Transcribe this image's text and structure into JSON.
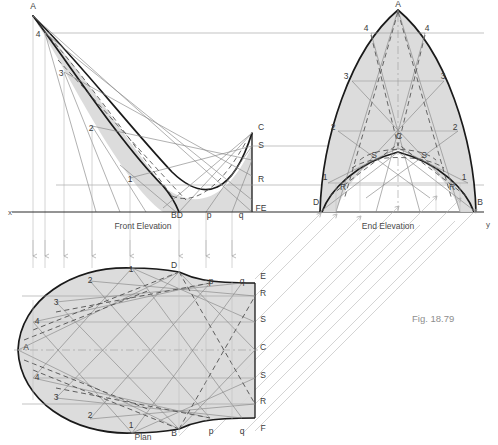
{
  "figure": {
    "caption": "Fig. 18.79",
    "caption_pos": {
      "x": 412,
      "y": 322
    }
  },
  "colors": {
    "outline": "#1a1a1a",
    "thin_line": "#9a9a9a",
    "medium_line": "#7d7d7d",
    "dashed_line": "#555555",
    "fill": "#d9d9d9",
    "fill_dark": "#cfcfcf",
    "projector": "#a8a8a8",
    "label_text": "#3a3a3a",
    "caption_text": "#8e8e8e",
    "background": "#ffffff"
  },
  "views": {
    "front_elevation": {
      "title": "Front Elevation",
      "title_pos": {
        "x": 143,
        "y": 229
      },
      "labels": [
        {
          "text": "A",
          "x": 33,
          "y": 9
        },
        {
          "text": "4",
          "x": 38,
          "y": 37
        },
        {
          "text": "3",
          "x": 61,
          "y": 76
        },
        {
          "text": "2",
          "x": 91,
          "y": 131
        },
        {
          "text": "1",
          "x": 130,
          "y": 182
        },
        {
          "text": "C",
          "x": 261,
          "y": 130
        },
        {
          "text": "S",
          "x": 261,
          "y": 148
        },
        {
          "text": "R",
          "x": 261,
          "y": 182
        },
        {
          "text": "FE",
          "x": 261,
          "y": 211
        },
        {
          "text": "BD",
          "x": 177,
          "y": 218
        },
        {
          "text": "p",
          "x": 209,
          "y": 218
        },
        {
          "text": "q",
          "x": 241,
          "y": 218
        }
      ]
    },
    "end_elevation": {
      "title": "End Elevation",
      "title_pos": {
        "x": 388,
        "y": 229
      },
      "labels": [
        {
          "text": "A",
          "x": 398,
          "y": 7
        },
        {
          "text": "4",
          "x": 366,
          "y": 31
        },
        {
          "text": "4",
          "x": 427,
          "y": 31
        },
        {
          "text": "3",
          "x": 346,
          "y": 79
        },
        {
          "text": "3",
          "x": 443,
          "y": 79
        },
        {
          "text": "2",
          "x": 333,
          "y": 130
        },
        {
          "text": "2",
          "x": 455,
          "y": 130
        },
        {
          "text": "1",
          "x": 325,
          "y": 180
        },
        {
          "text": "1",
          "x": 464,
          "y": 180
        },
        {
          "text": "C",
          "x": 399,
          "y": 139
        },
        {
          "text": "S",
          "x": 374,
          "y": 158
        },
        {
          "text": "S",
          "x": 424,
          "y": 158
        },
        {
          "text": "R",
          "x": 343,
          "y": 190
        },
        {
          "text": "R",
          "x": 452,
          "y": 190
        },
        {
          "text": "D",
          "x": 316,
          "y": 205
        },
        {
          "text": "B",
          "x": 480,
          "y": 205
        }
      ]
    },
    "plan": {
      "title": "Plan",
      "title_pos": {
        "x": 143,
        "y": 440
      },
      "labels": [
        {
          "text": "A",
          "x": 26,
          "y": 350
        },
        {
          "text": "1",
          "x": 131,
          "y": 272
        },
        {
          "text": "2",
          "x": 90,
          "y": 283
        },
        {
          "text": "3",
          "x": 56,
          "y": 305
        },
        {
          "text": "4",
          "x": 37,
          "y": 324
        },
        {
          "text": "4",
          "x": 37,
          "y": 380
        },
        {
          "text": "3",
          "x": 56,
          "y": 400
        },
        {
          "text": "2",
          "x": 90,
          "y": 418
        },
        {
          "text": "1",
          "x": 131,
          "y": 428
        },
        {
          "text": "D",
          "x": 174,
          "y": 268
        },
        {
          "text": "B",
          "x": 174,
          "y": 436
        },
        {
          "text": "p",
          "x": 211,
          "y": 284
        },
        {
          "text": "q",
          "x": 242,
          "y": 284
        },
        {
          "text": "p",
          "x": 211,
          "y": 434
        },
        {
          "text": "q",
          "x": 242,
          "y": 434
        },
        {
          "text": "E",
          "x": 263,
          "y": 279
        },
        {
          "text": "R",
          "x": 263,
          "y": 296
        },
        {
          "text": "S",
          "x": 263,
          "y": 322
        },
        {
          "text": "C",
          "x": 263,
          "y": 350
        },
        {
          "text": "S",
          "x": 263,
          "y": 378
        },
        {
          "text": "R",
          "x": 263,
          "y": 404
        },
        {
          "text": "F",
          "x": 263,
          "y": 431
        }
      ]
    }
  },
  "ground_line": {
    "x_label": "x",
    "y_label": "y",
    "x_label_pos": {
      "x": 8,
      "y": 215
    },
    "y_label_pos": {
      "x": 486,
      "y": 227
    },
    "y_position": 212,
    "x_start": 12,
    "x_end": 484
  }
}
